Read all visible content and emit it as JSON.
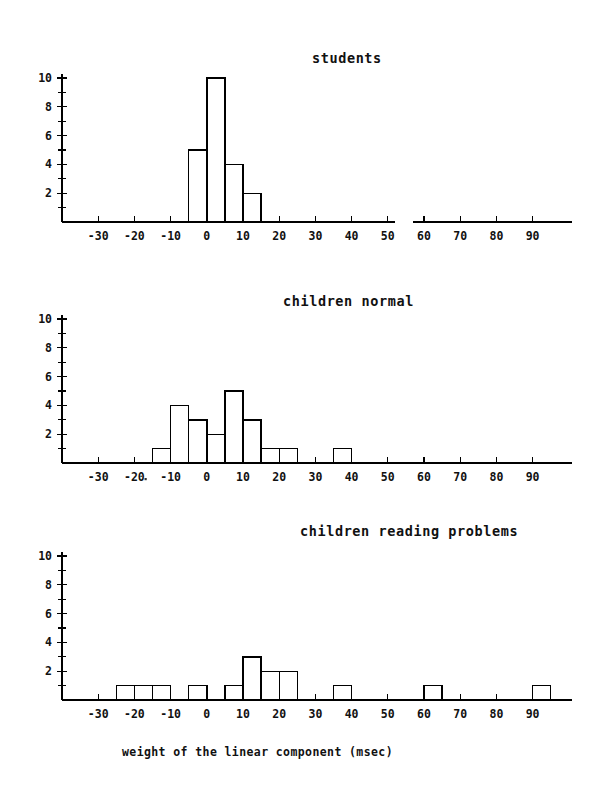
{
  "figure": {
    "xlabel": "weight of the linear component (msec)",
    "xlabel_name": "x-axis-label"
  },
  "chart_data": [
    {
      "type": "bar",
      "title": "students",
      "xlabel": "",
      "ylabel": "",
      "xlim": [
        -40,
        100
      ],
      "ylim": [
        0,
        10
      ],
      "xticks": [
        -30,
        -20,
        -10,
        0,
        10,
        20,
        30,
        40,
        50,
        60,
        70,
        80,
        90
      ],
      "xticklabels": [
        "-30",
        "-20",
        "-10",
        "0",
        "10",
        "20",
        "30",
        "40",
        "50",
        "60",
        "70",
        "80",
        "90"
      ],
      "yticks": [
        2,
        4,
        6,
        8,
        10
      ],
      "yticklabels": [
        "2",
        "4",
        "6",
        "8",
        "10"
      ],
      "minor_yticks": [
        1,
        3,
        5,
        7,
        9
      ],
      "grid": false,
      "bin_width": 5,
      "bin_starts": [
        -5,
        0,
        5,
        10
      ],
      "values": [
        5,
        10,
        4,
        2
      ]
    },
    {
      "type": "bar",
      "title": "children normal",
      "xlabel": "",
      "ylabel": "",
      "xlim": [
        -40,
        100
      ],
      "ylim": [
        0,
        10
      ],
      "xticks": [
        -30,
        -20,
        -10,
        0,
        10,
        20,
        30,
        40,
        50,
        60,
        70,
        80,
        90
      ],
      "xticklabels": [
        "-30",
        "-20",
        "-10",
        "0",
        "10",
        "20",
        "30",
        "40",
        "50",
        "60",
        "70",
        "80",
        "90"
      ],
      "yticks": [
        2,
        4,
        6,
        8,
        10
      ],
      "yticklabels": [
        "2",
        "4",
        "6",
        "8",
        "10"
      ],
      "minor_yticks": [
        1,
        3,
        5,
        7,
        9
      ],
      "grid": false,
      "bin_width": 5,
      "bin_starts": [
        -15,
        -10,
        -5,
        0,
        5,
        10,
        15,
        20,
        35
      ],
      "values": [
        1,
        4,
        3,
        2,
        5,
        3,
        1,
        1,
        1
      ]
    },
    {
      "type": "bar",
      "title": "children reading problems",
      "xlabel": "weight of the linear component (msec)",
      "ylabel": "",
      "xlim": [
        -40,
        100
      ],
      "ylim": [
        0,
        10
      ],
      "xticks": [
        -30,
        -20,
        -10,
        0,
        10,
        20,
        30,
        40,
        50,
        60,
        70,
        80,
        90
      ],
      "xticklabels": [
        "-30",
        "-20",
        "-10",
        "0",
        "10",
        "20",
        "30",
        "40",
        "50",
        "60",
        "70",
        "80",
        "90"
      ],
      "yticks": [
        2,
        4,
        6,
        8,
        10
      ],
      "yticklabels": [
        "2",
        "4",
        "6",
        "8",
        "10"
      ],
      "minor_yticks": [
        1,
        3,
        5,
        7,
        9
      ],
      "grid": false,
      "bin_width": 5,
      "bin_starts": [
        -25,
        -20,
        -15,
        -5,
        5,
        10,
        15,
        20,
        35,
        60,
        90
      ],
      "values": [
        1,
        1,
        1,
        1,
        1,
        3,
        2,
        2,
        1,
        1,
        1
      ]
    }
  ]
}
